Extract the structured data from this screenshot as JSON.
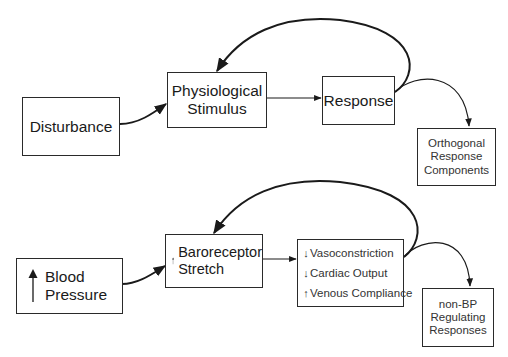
{
  "diagram": {
    "type": "feedback-flow",
    "top_row": {
      "disturbance": {
        "label": "Disturbance"
      },
      "stimulus": {
        "line1": "Physiological",
        "line2": "Stimulus"
      },
      "response": {
        "label": "Response"
      },
      "orthogonal": {
        "line1": "Orthogonal",
        "line2": "Response",
        "line3": "Components"
      }
    },
    "bottom_row": {
      "blood_pressure": {
        "arrow": "↑",
        "line1": "Blood",
        "line2": "Pressure"
      },
      "baroreceptor": {
        "arrow": "↑",
        "line1": "Baroreceptor",
        "line2": "Stretch"
      },
      "responses": {
        "items": [
          {
            "dir": "↓",
            "text": "Vasoconstriction"
          },
          {
            "dir": "↓",
            "text": "Cardiac Output"
          },
          {
            "dir": "↑",
            "text": "Venous Compliance"
          }
        ]
      },
      "non_bp": {
        "line1": "non-BP",
        "line2": "Regulating",
        "line3": "Responses"
      }
    },
    "colors": {
      "stroke": "#1a1a1a",
      "box_border": "#2a2a2a",
      "background": "#ffffff"
    }
  }
}
